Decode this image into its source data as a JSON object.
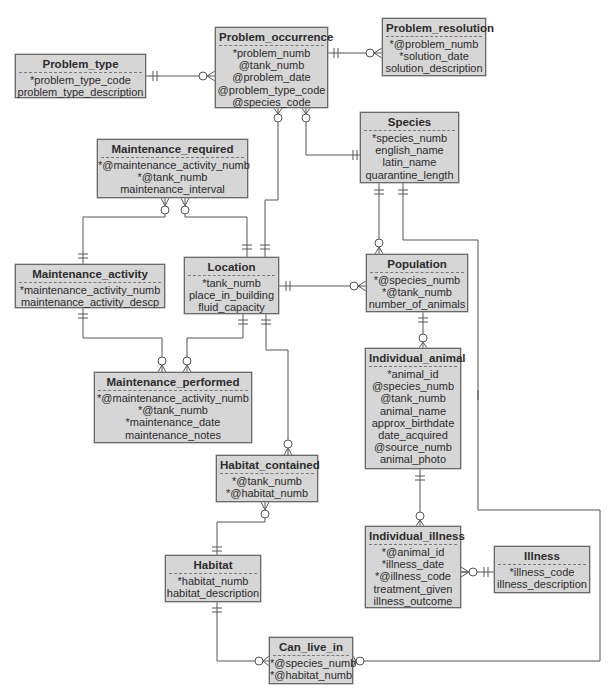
{
  "diagram": {
    "type": "entity-relationship",
    "notation": "crows-foot",
    "colors": {
      "entity_fill": "#d6d6d6",
      "entity_border": "#6a6a6a",
      "line": "#555555",
      "text": "#2c2c2c"
    },
    "entities": [
      {
        "id": "problem_type",
        "name": "Problem_type",
        "attributes": [
          "*problem_type_code",
          "problem_type_description"
        ]
      },
      {
        "id": "problem_occurrence",
        "name": "Problem_occurrence",
        "attributes": [
          "*problem_numb",
          "@tank_numb",
          "@problem_date",
          "@problem_type_code",
          "@species_code"
        ]
      },
      {
        "id": "problem_resolution",
        "name": "Problem_resolution",
        "attributes": [
          "*@problem_numb",
          "*solution_date",
          "solution_description"
        ]
      },
      {
        "id": "species",
        "name": "Species",
        "attributes": [
          "*species_numb",
          "english_name",
          "latin_name",
          "quarantine_length"
        ]
      },
      {
        "id": "maintenance_required",
        "name": "Maintenance_required",
        "attributes": [
          "*@maintenance_activity_numb",
          "*@tank_numb",
          "maintenance_interval"
        ]
      },
      {
        "id": "maintenance_activity",
        "name": "Maintenance_activity",
        "attributes": [
          "*maintenance_activity_numb",
          "maintenance_activity_descp"
        ]
      },
      {
        "id": "location",
        "name": "Location",
        "attributes": [
          "*tank_numb",
          "place_in_building",
          "fluid_capacity"
        ]
      },
      {
        "id": "population",
        "name": "Population",
        "attributes": [
          "*@species_numb",
          "*@tank_numb",
          "number_of_animals"
        ]
      },
      {
        "id": "maintenance_performed",
        "name": "Maintenance_performed",
        "attributes": [
          "*@maintenance_activity_numb",
          "*@tank_numb",
          "*maintenance_date",
          "maintenance_notes"
        ]
      },
      {
        "id": "individual_animal",
        "name": "Individual_animal",
        "attributes": [
          "*animal_id",
          "@species_numb",
          "@tank_numb",
          "animal_name",
          "approx_birthdate",
          "date_acquired",
          "@source_numb",
          "animal_photo"
        ]
      },
      {
        "id": "habitat_contained",
        "name": "Habitat_contained",
        "attributes": [
          "*@tank_numb",
          "*@habitat_numb"
        ]
      },
      {
        "id": "individual_illness",
        "name": "Individual_illness",
        "attributes": [
          "*@animal_id",
          "*illness_date",
          "*@illness_code",
          "treatment_given",
          "illness_outcome"
        ]
      },
      {
        "id": "illness",
        "name": "Illness",
        "attributes": [
          "*illness_code",
          "illness_description"
        ]
      },
      {
        "id": "habitat",
        "name": "Habitat",
        "attributes": [
          "*habitat_numb",
          "habitat_description"
        ]
      },
      {
        "id": "can_live_in",
        "name": "Can_live_in",
        "attributes": [
          "*@species_numb",
          "*@habitat_numb"
        ]
      }
    ],
    "relationships": [
      {
        "from": "Problem_type",
        "from_card": "one-and-only-one",
        "to": "Problem_occurrence",
        "to_card": "zero-or-many"
      },
      {
        "from": "Problem_occurrence",
        "from_card": "one-and-only-one",
        "to": "Problem_resolution",
        "to_card": "zero-or-many"
      },
      {
        "from": "Location",
        "from_card": "one-and-only-one",
        "to": "Problem_occurrence",
        "to_card": "zero-or-many"
      },
      {
        "from": "Species",
        "from_card": "one-and-only-one",
        "to": "Problem_occurrence",
        "to_card": "zero-or-many"
      },
      {
        "from": "Maintenance_activity",
        "from_card": "one-and-only-one",
        "to": "Maintenance_required",
        "to_card": "zero-or-many"
      },
      {
        "from": "Location",
        "from_card": "one-and-only-one",
        "to": "Maintenance_required",
        "to_card": "zero-or-many"
      },
      {
        "from": "Maintenance_activity",
        "from_card": "one-and-only-one",
        "to": "Maintenance_performed",
        "to_card": "zero-or-many"
      },
      {
        "from": "Location",
        "from_card": "one-and-only-one",
        "to": "Maintenance_performed",
        "to_card": "zero-or-many"
      },
      {
        "from": "Location",
        "from_card": "one-and-only-one",
        "to": "Population",
        "to_card": "zero-or-many"
      },
      {
        "from": "Species",
        "from_card": "one-and-only-one",
        "to": "Population",
        "to_card": "zero-or-many"
      },
      {
        "from": "Population",
        "from_card": "one-and-only-one",
        "to": "Individual_animal",
        "to_card": "zero-or-many"
      },
      {
        "from": "Location",
        "from_card": "one-and-only-one",
        "to": "Habitat_contained",
        "to_card": "zero-or-many"
      },
      {
        "from": "Habitat",
        "from_card": "one-and-only-one",
        "to": "Habitat_contained",
        "to_card": "zero-or-many"
      },
      {
        "from": "Individual_animal",
        "from_card": "one-and-only-one",
        "to": "Individual_illness",
        "to_card": "zero-or-many"
      },
      {
        "from": "Illness",
        "from_card": "one-and-only-one",
        "to": "Individual_illness",
        "to_card": "zero-or-many"
      },
      {
        "from": "Habitat",
        "from_card": "one-and-only-one",
        "to": "Can_live_in",
        "to_card": "zero-or-many"
      },
      {
        "from": "Species",
        "from_card": "one-and-only-one",
        "to": "Can_live_in",
        "to_card": "zero-or-many"
      }
    ]
  }
}
